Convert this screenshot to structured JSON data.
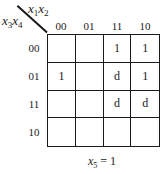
{
  "kmap": {
    "col_var": {
      "base": "x",
      "sub1": "1",
      "sub2": "2"
    },
    "row_var": {
      "base": "x",
      "sub1": "3",
      "sub2": "4"
    },
    "col_headers": [
      "00",
      "01",
      "11",
      "10"
    ],
    "row_headers": [
      "00",
      "01",
      "11",
      "10"
    ],
    "cells": [
      [
        "",
        "",
        "1",
        "1"
      ],
      [
        "1",
        "",
        "d",
        "1"
      ],
      [
        "",
        "",
        "d",
        "d"
      ],
      [
        "",
        "",
        "",
        ""
      ]
    ],
    "caption": {
      "var": "x",
      "sub": "5",
      "rest": " = 1"
    }
  }
}
